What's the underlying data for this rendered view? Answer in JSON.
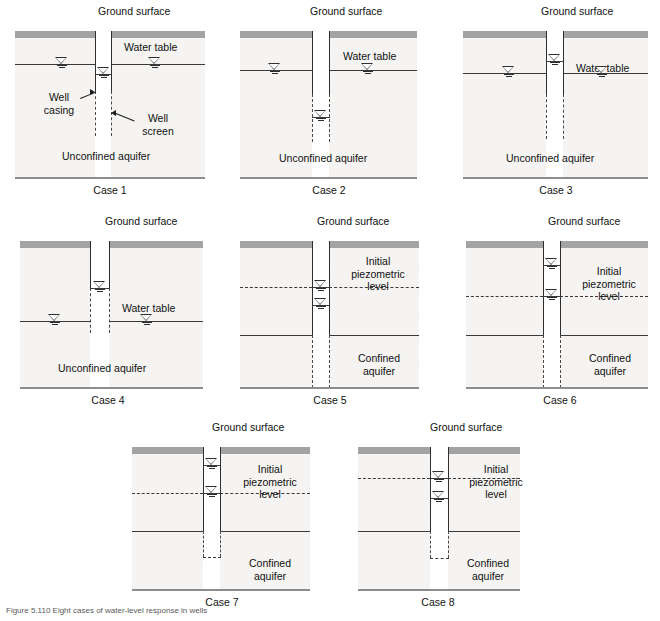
{
  "figure": {
    "caption": "Figure 5.110  Eight cases of water-level response in wells",
    "ground_surface_label": "Ground surface",
    "water_table_label": "Water table",
    "unconfined_label": "Unconfined aquifer",
    "confined_label": "Confined aquifer",
    "piezometric_label_line1": "Initial",
    "piezometric_label_line2": "piezometric",
    "piezometric_label_line3": "level",
    "well_casing_label_line1": "Well",
    "well_casing_label_line2": "casing",
    "well_screen_label_line1": "Well",
    "well_screen_label_line2": "screen",
    "symbol_name": "water-level-triangle"
  },
  "colors": {
    "topsoil": "#a3a3a3",
    "soil_fill": "#f5f4f2",
    "line": "#2e2e2e",
    "bottom_line": "#8d8d8d",
    "text": "#111111"
  },
  "cases": [
    {
      "id": "case-1",
      "label": "Case 1",
      "aquifer_type": "Unconfined aquifer",
      "aquifer_label": "Unconfined aquifer",
      "ground_surface_label": "Ground surface",
      "water_table_label": "Water table",
      "well_water_level": "below water table",
      "screen_type": "full-length open screen",
      "annotations": [
        "Well casing",
        "Well screen"
      ]
    },
    {
      "id": "case-2",
      "label": "Case 2",
      "aquifer_type": "Unconfined aquifer",
      "aquifer_label": "Unconfined aquifer",
      "ground_surface_label": "Ground surface",
      "water_table_label": "Water table",
      "well_water_level": "well below water table",
      "screen_type": "deep screen"
    },
    {
      "id": "case-3",
      "label": "Case 3",
      "aquifer_type": "Unconfined aquifer",
      "aquifer_label": "Unconfined aquifer",
      "ground_surface_label": "Ground surface",
      "water_table_label": "Water table",
      "well_water_level": "above water table",
      "screen_type": "deep screen"
    },
    {
      "id": "case-4",
      "label": "Case 4",
      "aquifer_type": "Unconfined aquifer",
      "aquifer_label": "Unconfined aquifer",
      "ground_surface_label": "Ground surface",
      "water_table_label": "Water table",
      "well_water_level": "well above water table",
      "screen_type": "deep screen"
    },
    {
      "id": "case-5",
      "label": "Case 5",
      "aquifer_type": "Confined aquifer",
      "aquifer_label": "Confined aquifer",
      "ground_surface_label": "Ground surface",
      "piezometric_label": "Initial piezometric level",
      "well_water_level": "at and below piezometric level",
      "screen_type": "full-depth screen"
    },
    {
      "id": "case-6",
      "label": "Case 6",
      "aquifer_type": "Confined aquifer",
      "aquifer_label": "Confined aquifer",
      "ground_surface_label": "Ground surface",
      "piezometric_label": "Initial piezometric level",
      "well_water_level": "above and at piezometric level",
      "screen_type": "full-depth screen"
    },
    {
      "id": "case-7",
      "label": "Case 7",
      "aquifer_type": "Confined aquifer",
      "aquifer_label": "Confined aquifer",
      "ground_surface_label": "Ground surface",
      "piezometric_label": "Initial piezometric level",
      "well_water_level": "above and at piezometric level",
      "screen_type": "short screen at base"
    },
    {
      "id": "case-8",
      "label": "Case 8",
      "aquifer_type": "Confined aquifer",
      "aquifer_label": "Confined aquifer",
      "ground_surface_label": "Ground surface",
      "piezometric_label": "Initial piezometric level",
      "well_water_level": "at and below piezometric level",
      "screen_type": "short screen at base"
    }
  ]
}
